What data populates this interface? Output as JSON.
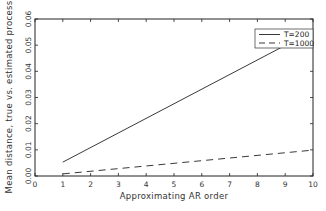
{
  "chart_data": {
    "type": "line",
    "title": "",
    "xlabel": "Approximating AR order",
    "ylabel": "Mean distance, true vs. estimated process",
    "xlim": [
      0,
      10
    ],
    "ylim": [
      0,
      0.06
    ],
    "xticks": [
      "0",
      "1",
      "2",
      "3",
      "4",
      "5",
      "6",
      "7",
      "8",
      "9",
      "10"
    ],
    "yticks": [
      "0.00",
      "0.01",
      "0.02",
      "0.03",
      "0.04",
      "0.05",
      "0.06"
    ],
    "grid": false,
    "legend_position": "upper right",
    "x": [
      1,
      10
    ],
    "series": [
      {
        "name": "T=200",
        "style": "solid",
        "values": [
          0.0053,
          0.0555
        ]
      },
      {
        "name": "T=1000",
        "style": "dashed",
        "values": [
          0.0008,
          0.0099
        ]
      }
    ]
  }
}
